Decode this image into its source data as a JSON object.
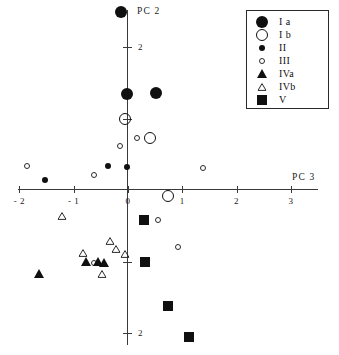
{
  "chart_data": {
    "type": "scatter",
    "title": "",
    "subtitle": "",
    "xlabel": "PC 3",
    "ylabel": "PC 2",
    "xlim": [
      -2.35,
      3.6
    ],
    "ylim": [
      -2.55,
      2.55
    ],
    "xticks": [
      -2,
      -1,
      0,
      1,
      2,
      3
    ],
    "xticklabels": [
      "- 2",
      "- 1",
      "0",
      "1",
      "2",
      "3"
    ],
    "yticks": [
      2,
      1,
      -1,
      -2
    ],
    "yticklabels": [
      "2",
      "",
      "",
      "2"
    ],
    "grid": false,
    "legend_position": "top-right",
    "legend": [
      {
        "key": "ia",
        "label": "I a",
        "marker": "filled-circle-large"
      },
      {
        "key": "ib",
        "label": "I b",
        "marker": "open-circle-large"
      },
      {
        "key": "ii",
        "label": "II",
        "marker": "filled-circle-small"
      },
      {
        "key": "iii",
        "label": "III",
        "marker": "open-circle-small"
      },
      {
        "key": "iva",
        "label": "IVa",
        "marker": "filled-triangle"
      },
      {
        "key": "ivb",
        "label": "IVb",
        "marker": "open-triangle"
      },
      {
        "key": "v",
        "label": "V",
        "marker": "filled-square"
      }
    ],
    "series": [
      {
        "name": "I a",
        "key": "ia",
        "marker": "filled-circle-large",
        "points": [
          {
            "x": -0.13,
            "y": 2.49
          },
          {
            "x": -0.02,
            "y": 1.34
          },
          {
            "x": 0.52,
            "y": 1.35
          }
        ]
      },
      {
        "name": "I b",
        "key": "ib",
        "marker": "open-circle-large",
        "points": [
          {
            "x": -0.05,
            "y": 0.99
          },
          {
            "x": 0.41,
            "y": 0.73
          },
          {
            "x": 0.73,
            "y": -0.09
          }
        ]
      },
      {
        "name": "II",
        "key": "ii",
        "marker": "filled-circle-small",
        "points": [
          {
            "x": -0.02,
            "y": 0.32
          },
          {
            "x": -0.36,
            "y": 0.34
          },
          {
            "x": -1.52,
            "y": 0.14
          }
        ]
      },
      {
        "name": "III",
        "key": "iii",
        "marker": "open-circle-small",
        "points": [
          {
            "x": -0.15,
            "y": 0.62
          },
          {
            "x": 0.17,
            "y": 0.73
          },
          {
            "x": -0.63,
            "y": 0.21
          },
          {
            "x": -1.86,
            "y": 0.34
          },
          {
            "x": 1.38,
            "y": 0.31
          },
          {
            "x": 0.56,
            "y": -0.42
          },
          {
            "x": 0.93,
            "y": -0.8
          },
          {
            "x": -0.62,
            "y": -1.02
          }
        ]
      },
      {
        "name": "IVa",
        "key": "iva",
        "marker": "filled-triangle",
        "points": [
          {
            "x": -1.63,
            "y": -1.17
          },
          {
            "x": -0.77,
            "y": -1.01
          },
          {
            "x": -0.56,
            "y": -1.01
          },
          {
            "x": -0.44,
            "y": -1.02
          }
        ]
      },
      {
        "name": "IVb",
        "key": "ivb",
        "marker": "open-triangle",
        "points": [
          {
            "x": -1.22,
            "y": -0.36
          },
          {
            "x": -0.82,
            "y": -0.88
          },
          {
            "x": -0.34,
            "y": -0.72
          },
          {
            "x": -0.22,
            "y": -0.82
          },
          {
            "x": -0.05,
            "y": -0.89
          },
          {
            "x": -0.47,
            "y": -1.17
          }
        ]
      },
      {
        "name": "V",
        "key": "v",
        "marker": "filled-square",
        "points": [
          {
            "x": 0.3,
            "y": -0.42
          },
          {
            "x": 0.32,
            "y": -1.0
          },
          {
            "x": 0.74,
            "y": -1.62
          },
          {
            "x": 1.12,
            "y": -2.05
          }
        ]
      }
    ]
  },
  "geometry": {
    "origin_x": 128,
    "origin_y": 190,
    "px_per_unit_x": 54.3,
    "px_per_unit_y": 71.5
  }
}
